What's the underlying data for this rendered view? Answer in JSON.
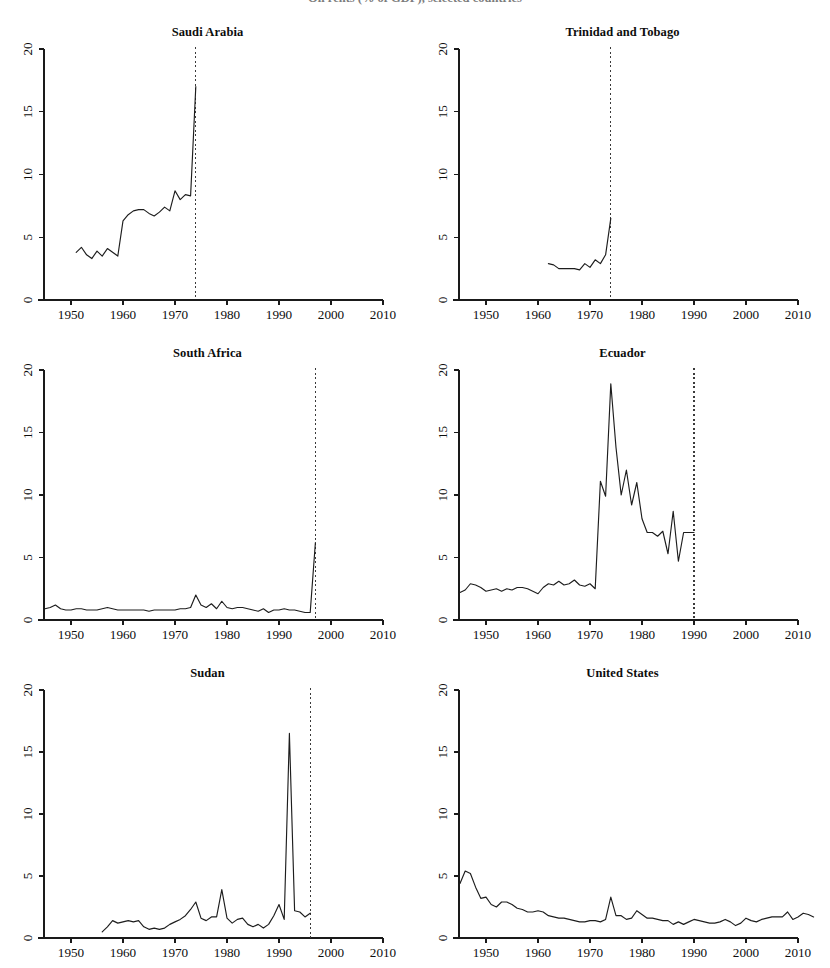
{
  "figure": {
    "suptitle_clipped": "Oil rents (% of GDP), selected countries",
    "background_color": "#ffffff",
    "line_color": "#1d1d1d",
    "event_line_color": "#3a3a3a",
    "rows": 3,
    "cols": 2
  },
  "axes_common": {
    "xlim": [
      1944,
      2014
    ],
    "ylim": [
      0,
      20
    ],
    "xticks": [
      1950,
      1960,
      1970,
      1980,
      1990,
      2000,
      2010
    ],
    "xtick_labels": [
      "1950",
      "1960",
      "1970",
      "1980",
      "1990",
      "2000",
      "2010"
    ],
    "yticks": [
      0,
      5,
      10,
      15,
      20
    ],
    "ytick_labels": [
      "0",
      "5",
      "10",
      "15",
      "20"
    ],
    "grid": false,
    "legend": "none",
    "xlabel": "",
    "ylabel": ""
  },
  "chart_data": [
    {
      "type": "line",
      "title": "Saudi Arabia",
      "xlabel": "",
      "ylabel": "",
      "xlim": [
        1944,
        2014
      ],
      "ylim": [
        0,
        20
      ],
      "grid": false,
      "event_year": 1974,
      "x": [
        1951,
        1952,
        1953,
        1954,
        1955,
        1956,
        1957,
        1958,
        1959,
        1960,
        1961,
        1962,
        1963,
        1964,
        1965,
        1966,
        1967,
        1968,
        1969,
        1970,
        1971,
        1972,
        1973,
        1974
      ],
      "values": [
        3.8,
        4.2,
        3.6,
        3.3,
        3.9,
        3.5,
        4.1,
        3.8,
        3.5,
        6.3,
        6.8,
        7.1,
        7.2,
        7.2,
        6.9,
        6.7,
        7.0,
        7.4,
        7.1,
        8.7,
        8.0,
        8.4,
        8.3,
        17.0
      ]
    },
    {
      "type": "line",
      "title": "Trinidad and Tobago",
      "xlabel": "",
      "ylabel": "",
      "xlim": [
        1944,
        2014
      ],
      "ylim": [
        0,
        20
      ],
      "grid": false,
      "event_year": 1974,
      "x": [
        1962,
        1963,
        1964,
        1965,
        1966,
        1967,
        1968,
        1969,
        1970,
        1971,
        1972,
        1973,
        1974
      ],
      "values": [
        2.9,
        2.8,
        2.5,
        2.5,
        2.5,
        2.5,
        2.4,
        2.9,
        2.6,
        3.2,
        2.9,
        3.6,
        6.5
      ]
    },
    {
      "type": "line",
      "title": "South Africa",
      "xlabel": "",
      "ylabel": "",
      "xlim": [
        1944,
        2014
      ],
      "ylim": [
        0,
        20
      ],
      "grid": false,
      "event_year": 1997,
      "x": [
        1945,
        1946,
        1947,
        1948,
        1949,
        1950,
        1951,
        1952,
        1953,
        1954,
        1955,
        1956,
        1957,
        1958,
        1959,
        1960,
        1961,
        1962,
        1963,
        1964,
        1965,
        1966,
        1967,
        1968,
        1969,
        1970,
        1971,
        1972,
        1973,
        1974,
        1975,
        1976,
        1977,
        1978,
        1979,
        1980,
        1981,
        1982,
        1983,
        1984,
        1985,
        1986,
        1987,
        1988,
        1989,
        1990,
        1991,
        1992,
        1993,
        1994,
        1995,
        1996,
        1997
      ],
      "values": [
        0.9,
        1.0,
        1.2,
        0.9,
        0.8,
        0.8,
        0.9,
        0.9,
        0.8,
        0.8,
        0.8,
        0.9,
        1.0,
        0.9,
        0.8,
        0.8,
        0.8,
        0.8,
        0.8,
        0.8,
        0.7,
        0.8,
        0.8,
        0.8,
        0.8,
        0.8,
        0.9,
        0.9,
        1.0,
        2.0,
        1.2,
        1.0,
        1.3,
        0.9,
        1.5,
        1.0,
        0.9,
        1.0,
        1.0,
        0.9,
        0.8,
        0.7,
        0.9,
        0.6,
        0.8,
        0.8,
        0.9,
        0.8,
        0.8,
        0.7,
        0.6,
        0.6,
        6.2
      ]
    },
    {
      "type": "line",
      "title": "Ecuador",
      "xlabel": "",
      "ylabel": "",
      "xlim": [
        1944,
        2014
      ],
      "ylim": [
        0,
        20
      ],
      "grid": false,
      "event_year": 1990,
      "x": [
        1945,
        1946,
        1947,
        1948,
        1949,
        1950,
        1951,
        1952,
        1953,
        1954,
        1955,
        1956,
        1957,
        1958,
        1959,
        1960,
        1961,
        1962,
        1963,
        1964,
        1965,
        1966,
        1967,
        1968,
        1969,
        1970,
        1971,
        1972,
        1973,
        1974,
        1975,
        1976,
        1977,
        1978,
        1979,
        1980,
        1981,
        1982,
        1983,
        1984,
        1985,
        1986,
        1987,
        1988,
        1989,
        1990
      ],
      "values": [
        2.2,
        2.4,
        2.9,
        2.8,
        2.6,
        2.3,
        2.4,
        2.5,
        2.3,
        2.5,
        2.4,
        2.6,
        2.6,
        2.5,
        2.3,
        2.1,
        2.6,
        2.9,
        2.8,
        3.1,
        2.8,
        2.9,
        3.2,
        2.8,
        2.7,
        2.9,
        2.5,
        11.1,
        9.9,
        18.9,
        13.8,
        10.0,
        12.0,
        9.2,
        11.0,
        8.1,
        7.0,
        7.0,
        6.7,
        7.1,
        5.3,
        8.7,
        4.7,
        7.0,
        7.0,
        7.0
      ]
    },
    {
      "type": "line",
      "title": "Sudan",
      "xlabel": "",
      "ylabel": "",
      "xlim": [
        1944,
        2014
      ],
      "ylim": [
        0,
        20
      ],
      "grid": false,
      "event_year": 1996,
      "x": [
        1956,
        1957,
        1958,
        1959,
        1960,
        1961,
        1962,
        1963,
        1964,
        1965,
        1966,
        1967,
        1968,
        1969,
        1970,
        1971,
        1972,
        1973,
        1974,
        1975,
        1976,
        1977,
        1978,
        1979,
        1980,
        1981,
        1982,
        1983,
        1984,
        1985,
        1986,
        1987,
        1988,
        1989,
        1990,
        1991,
        1992,
        1993,
        1994,
        1995,
        1996
      ],
      "values": [
        0.5,
        0.9,
        1.4,
        1.2,
        1.3,
        1.4,
        1.3,
        1.4,
        0.9,
        0.7,
        0.8,
        0.7,
        0.8,
        1.1,
        1.3,
        1.5,
        1.8,
        2.3,
        2.9,
        1.6,
        1.4,
        1.7,
        1.7,
        3.9,
        1.6,
        1.2,
        1.5,
        1.6,
        1.1,
        0.9,
        1.1,
        0.8,
        1.1,
        1.8,
        2.7,
        1.5,
        16.5,
        2.2,
        2.1,
        1.7,
        2.0
      ]
    },
    {
      "type": "line",
      "title": "United States",
      "xlabel": "",
      "ylabel": "",
      "xlim": [
        1944,
        2014
      ],
      "ylim": [
        0,
        20
      ],
      "grid": false,
      "event_year": null,
      "x": [
        1945,
        1946,
        1947,
        1948,
        1949,
        1950,
        1951,
        1952,
        1953,
        1954,
        1955,
        1956,
        1957,
        1958,
        1959,
        1960,
        1961,
        1962,
        1963,
        1964,
        1965,
        1966,
        1967,
        1968,
        1969,
        1970,
        1971,
        1972,
        1973,
        1974,
        1975,
        1976,
        1977,
        1978,
        1979,
        1980,
        1981,
        1982,
        1983,
        1984,
        1985,
        1986,
        1987,
        1988,
        1989,
        1990,
        1991,
        1992,
        1993,
        1994,
        1995,
        1996,
        1997,
        1998,
        1999,
        2000,
        2001,
        2002,
        2003,
        2004,
        2005,
        2006,
        2007,
        2008,
        2009,
        2010,
        2011,
        2012,
        2013
      ],
      "values": [
        4.4,
        5.4,
        5.2,
        4.1,
        3.2,
        3.3,
        2.7,
        2.5,
        2.9,
        2.9,
        2.7,
        2.4,
        2.3,
        2.1,
        2.1,
        2.2,
        2.1,
        1.8,
        1.7,
        1.6,
        1.6,
        1.5,
        1.4,
        1.3,
        1.3,
        1.4,
        1.4,
        1.3,
        1.5,
        3.3,
        1.8,
        1.8,
        1.5,
        1.6,
        2.2,
        1.9,
        1.6,
        1.6,
        1.5,
        1.4,
        1.4,
        1.1,
        1.3,
        1.1,
        1.3,
        1.5,
        1.4,
        1.3,
        1.2,
        1.2,
        1.3,
        1.5,
        1.3,
        1.0,
        1.2,
        1.6,
        1.4,
        1.3,
        1.5,
        1.6,
        1.7,
        1.7,
        1.7,
        2.1,
        1.5,
        1.7,
        2.0,
        1.9,
        1.7
      ]
    }
  ]
}
